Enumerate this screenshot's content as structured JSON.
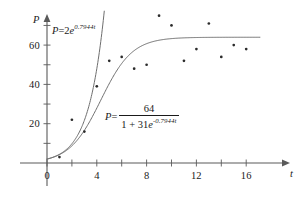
{
  "figure": {
    "title": "",
    "background_color": "#ffffff",
    "axis_color": "#5a5a5a",
    "curve_color": "#6e6e6e",
    "point_color": "#2b2b2b"
  },
  "axes": {
    "x_name": "t",
    "y_name": "P",
    "x_tick_labels": [
      "0",
      "4",
      "8",
      "12",
      "16"
    ],
    "y_tick_labels": [
      "20",
      "40",
      "60"
    ]
  },
  "equations": {
    "exponential": {
      "lhs": "P",
      "equals": "=",
      "coefficient": "2",
      "base": "e",
      "exponent": "0.7944t",
      "plain": "P = 2e^(0.7944t)"
    },
    "logistic": {
      "lhs": "P",
      "equals": "=",
      "numerator": "64",
      "denominator_lead": "1 + 31",
      "denominator_base": "e",
      "denominator_exponent": "-0.7944t",
      "plain": "P = 64 / (1 + 31e^(-0.7944t))"
    }
  },
  "chart_data": {
    "type": "scatter",
    "title": "",
    "xlabel": "t",
    "ylabel": "P",
    "xlim": [
      -0.6,
      17.6
    ],
    "ylim": [
      -2,
      80
    ],
    "grid": false,
    "legend": "none",
    "x_ticks": [
      0,
      2,
      4,
      6,
      8,
      10,
      12,
      14,
      16
    ],
    "x_tick_labels": [
      "0",
      "",
      "4",
      "",
      "8",
      "",
      "12",
      "",
      "16"
    ],
    "y_ticks": [
      10,
      20,
      30,
      40,
      50,
      60,
      70
    ],
    "y_tick_labels": [
      "",
      "20",
      "",
      "40",
      "",
      "60",
      ""
    ],
    "scatter": {
      "name": "observed data",
      "x": [
        1,
        2,
        3,
        4,
        5,
        6,
        7,
        8,
        9,
        10,
        11,
        12,
        13,
        14,
        15,
        16
      ],
      "y": [
        3,
        22,
        16,
        39,
        52,
        54,
        48,
        50,
        75,
        70,
        52,
        58,
        71,
        54,
        60,
        58
      ]
    },
    "series": [
      {
        "name": "P = 2e^(0.7944t)",
        "type": "line",
        "formula": "2 * exp(0.7944 * t)",
        "params": {
          "a": 2,
          "k": 0.7944
        },
        "x_range": [
          0,
          4.6
        ]
      },
      {
        "name": "P = 64 / (1 + 31e^(-0.7944t))",
        "type": "line",
        "formula": "64 / (1 + 31 * exp(-0.7944 * t))",
        "params": {
          "L": 64,
          "a": 31,
          "k": 0.7944
        },
        "x_range": [
          0,
          17.1
        ]
      }
    ]
  }
}
